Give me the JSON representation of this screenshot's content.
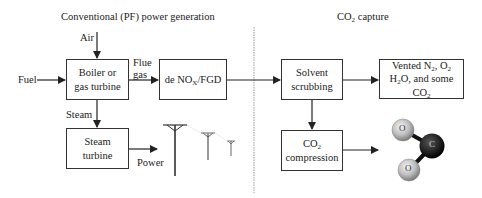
{
  "sections": {
    "left_title": "Conventional (PF) power generation",
    "right_title_pre": "CO",
    "right_title_sub": "2",
    "right_title_post": " capture"
  },
  "inputs": {
    "air": "Air",
    "fuel": "Fuel",
    "flue_line1": "Flue",
    "flue_line2": "gas",
    "steam": "Steam",
    "power": "Power"
  },
  "boxes": {
    "boiler_line1": "Boiler or",
    "boiler_line2": "gas turbine",
    "denox_pre": "de NO",
    "denox_sub": "X",
    "denox_post": "/FGD",
    "steam_turbine_line1": "Steam",
    "steam_turbine_line2": "turbine",
    "solvent_line1": "Solvent",
    "solvent_line2": "scrubbing",
    "vented_a": "Vented N",
    "vented_a_sub": "2",
    "vented_b": ", O",
    "vented_b_sub": "2",
    "vented_c": "H",
    "vented_c_sub": "2",
    "vented_d": "O, and some CO",
    "vented_d_sub": "2",
    "compression_pre": "CO",
    "compression_sub": "2",
    "compression_line2": "compression"
  },
  "molecule": {
    "atom_o1": "O",
    "atom_c": "C",
    "atom_o2": "O"
  }
}
